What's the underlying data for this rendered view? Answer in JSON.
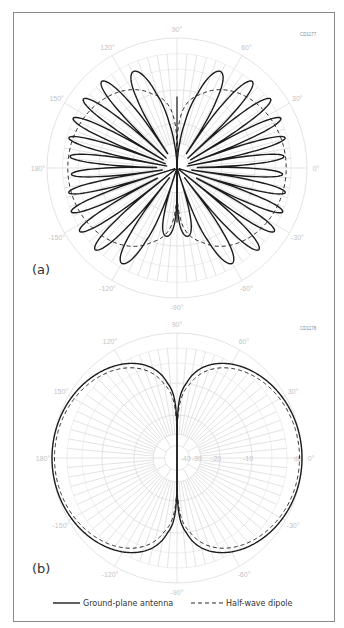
{
  "chart_data": [
    {
      "type": "line",
      "subtype": "polar",
      "panel_label": "(a)",
      "figure_code": "CD1177",
      "angle_ticks": [
        "90°",
        "60°",
        "30°",
        "0°",
        "-30°",
        "-60°",
        "-90°",
        "-120°",
        "-150°",
        "180°",
        "150°",
        "120°"
      ],
      "angle_tick_degrees": [
        90,
        60,
        30,
        0,
        -30,
        -60,
        -90,
        -120,
        -150,
        180,
        150,
        120
      ],
      "radial_unit": "dB",
      "radial_rings_db": [
        -40,
        -30,
        -20,
        -10,
        0
      ],
      "grid": true,
      "series": [
        {
          "name": "Ground-plane antenna",
          "style": "solid",
          "description": "Multi-lobed pattern, vertical null at ±90°, 12 major lobes per side, largest lobes near ±70°",
          "lobe_count_per_half": 12,
          "max_lobe_db": 0,
          "lobe_peaks_deg": [
            70,
            52,
            40,
            29,
            18,
            7,
            -4,
            -15,
            -27,
            -38,
            -50,
            -68
          ]
        },
        {
          "name": "Half-wave dipole",
          "style": "dashed",
          "description": "Circular-like lobes touching near ±90°",
          "peak_db": -4
        }
      ]
    },
    {
      "type": "line",
      "subtype": "polar",
      "panel_label": "(b)",
      "figure_code": "CD1178",
      "angle_ticks": [
        "90°",
        "60°",
        "30°",
        "0°",
        "-30°",
        "-60°",
        "-90°",
        "-120°",
        "-150°",
        "180°",
        "150°",
        "120°"
      ],
      "angle_tick_degrees": [
        90,
        60,
        30,
        0,
        -30,
        -60,
        -90,
        -120,
        -150,
        180,
        150,
        120
      ],
      "radial_unit": "dB",
      "radial_rings_db": [
        -40,
        -30,
        -20,
        -10,
        0
      ],
      "radial_tick_labels": [
        "-40",
        "-30",
        "-20",
        "-10",
        "dB"
      ],
      "grid": true,
      "series": [
        {
          "name": "Ground-plane antenna",
          "style": "solid",
          "peak_db": 0,
          "null_deg": [
            90,
            -90
          ]
        },
        {
          "name": "Half-wave dipole",
          "style": "dashed",
          "peak_db": -0.5,
          "null_deg": [
            90,
            -90
          ]
        }
      ]
    }
  ],
  "legend": {
    "placement": "bottom",
    "items": [
      {
        "label": "Ground-plane antenna",
        "style": "solid"
      },
      {
        "label": "Half-wave dipole",
        "style": "dashed"
      }
    ]
  }
}
